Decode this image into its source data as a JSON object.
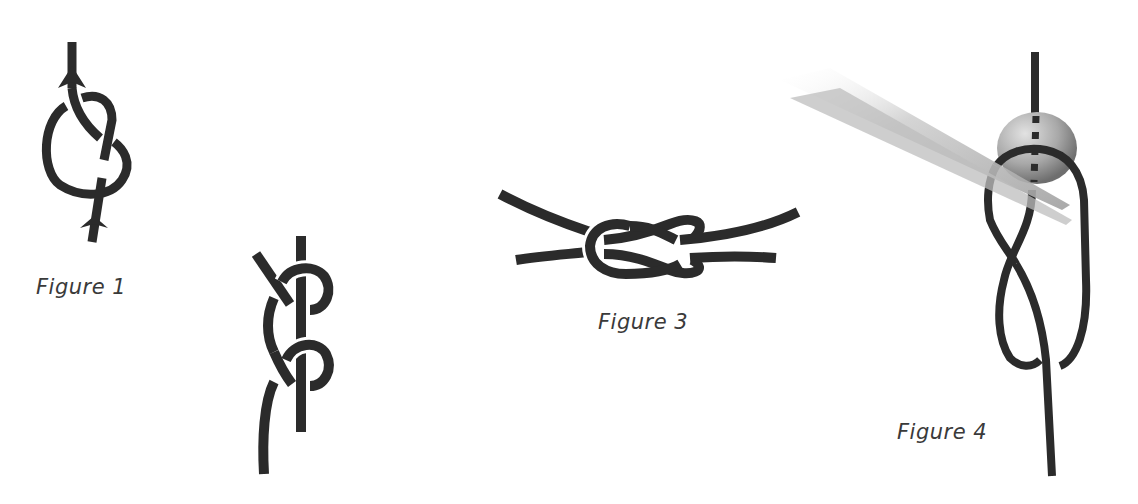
{
  "figures": [
    {
      "id": "figure-1",
      "label": "Figure 1",
      "description": "figure-eight knot with direction arrows"
    },
    {
      "id": "figure-2",
      "label": "",
      "description": "double overhand knot around vertical cord"
    },
    {
      "id": "figure-3",
      "label": "Figure 3",
      "description": "reef (square) knot joining two cords"
    },
    {
      "id": "figure-4",
      "label": "Figure 4",
      "description": "cord threaded through bead with tweezers"
    }
  ],
  "colors": {
    "background": "#ffffff",
    "rope": "#2b2b2b",
    "label": "#3a3a3a",
    "bead_light": "#d8d8d8",
    "bead_dark": "#7a7a7a",
    "tweezer": "#c8c8c8"
  }
}
